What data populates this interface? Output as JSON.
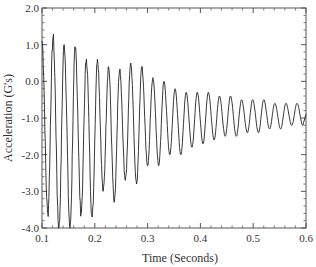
{
  "chart_data": {
    "type": "line",
    "title": "",
    "xlabel": "Time (Seconds)",
    "ylabel": "Acceleration (G's)",
    "xlim": [
      0.1,
      0.6
    ],
    "ylim": [
      -4.0,
      2.0
    ],
    "x_ticks": [
      "0.1",
      "0.2",
      "0.3",
      "0.4",
      "0.5",
      "0.6"
    ],
    "y_ticks": [
      "2.0",
      "1.0",
      "0.0",
      "-1.0",
      "-2.0",
      "-3.0",
      "-4.0"
    ],
    "grid": false,
    "legend": null,
    "series": [
      {
        "name": "Acceleration",
        "color": "#222222",
        "description": "Decaying oscillation (~48 Hz) with high-frequency noise, mean approx -0.9 G",
        "peaks": [
          {
            "x": 0.1,
            "y": 1.1
          },
          {
            "x": 0.121,
            "y": 1.2
          },
          {
            "x": 0.142,
            "y": 1.0
          },
          {
            "x": 0.163,
            "y": 0.9
          },
          {
            "x": 0.184,
            "y": 0.6
          },
          {
            "x": 0.205,
            "y": 0.6
          },
          {
            "x": 0.226,
            "y": 0.4
          },
          {
            "x": 0.247,
            "y": 0.3
          },
          {
            "x": 0.268,
            "y": 0.5
          },
          {
            "x": 0.289,
            "y": 0.4
          },
          {
            "x": 0.31,
            "y": 0.1
          },
          {
            "x": 0.331,
            "y": 0.0
          },
          {
            "x": 0.352,
            "y": -0.2
          },
          {
            "x": 0.373,
            "y": -0.3
          },
          {
            "x": 0.394,
            "y": -0.3
          },
          {
            "x": 0.415,
            "y": -0.3
          },
          {
            "x": 0.436,
            "y": -0.4
          },
          {
            "x": 0.457,
            "y": -0.4
          },
          {
            "x": 0.478,
            "y": -0.5
          },
          {
            "x": 0.499,
            "y": -0.5
          },
          {
            "x": 0.52,
            "y": -0.5
          },
          {
            "x": 0.541,
            "y": -0.6
          },
          {
            "x": 0.562,
            "y": -0.6
          },
          {
            "x": 0.583,
            "y": -0.6
          }
        ],
        "troughs": [
          {
            "x": 0.111,
            "y": -3.6
          },
          {
            "x": 0.132,
            "y": -4.0
          },
          {
            "x": 0.153,
            "y": -4.0
          },
          {
            "x": 0.174,
            "y": -3.6
          },
          {
            "x": 0.195,
            "y": -3.7
          },
          {
            "x": 0.216,
            "y": -3.0
          },
          {
            "x": 0.237,
            "y": -3.3
          },
          {
            "x": 0.258,
            "y": -2.7
          },
          {
            "x": 0.279,
            "y": -2.8
          },
          {
            "x": 0.3,
            "y": -2.3
          },
          {
            "x": 0.321,
            "y": -2.3
          },
          {
            "x": 0.342,
            "y": -2.0
          },
          {
            "x": 0.363,
            "y": -2.0
          },
          {
            "x": 0.384,
            "y": -1.8
          },
          {
            "x": 0.405,
            "y": -1.7
          },
          {
            "x": 0.426,
            "y": -1.6
          },
          {
            "x": 0.447,
            "y": -1.5
          },
          {
            "x": 0.468,
            "y": -1.5
          },
          {
            "x": 0.489,
            "y": -1.4
          },
          {
            "x": 0.51,
            "y": -1.4
          },
          {
            "x": 0.531,
            "y": -1.3
          },
          {
            "x": 0.552,
            "y": -1.3
          },
          {
            "x": 0.573,
            "y": -1.2
          },
          {
            "x": 0.594,
            "y": -1.2
          }
        ]
      }
    ]
  }
}
